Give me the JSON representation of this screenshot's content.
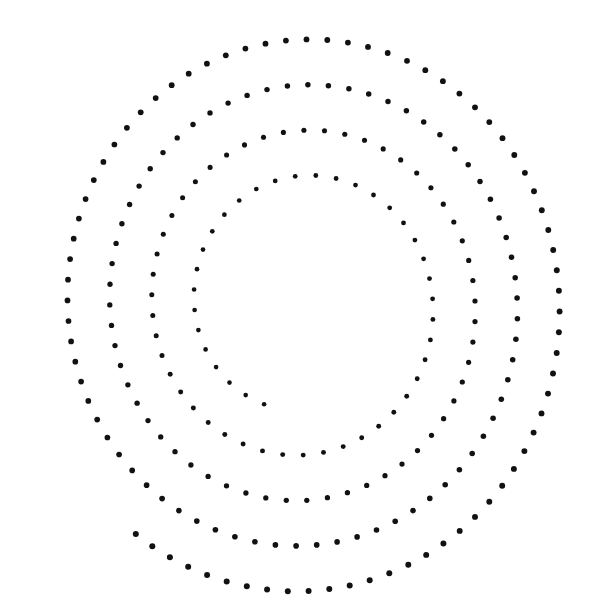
{
  "figure": {
    "description": "Dotted spiral",
    "background": "#ffffff",
    "dot_color": "#111111",
    "width": 601,
    "height": 613
  },
  "spiral": {
    "center_x": 303,
    "center_y": 304,
    "x_scale": 0.93,
    "y_scale": 1.0,
    "start_radius": 292,
    "end_radius": 108,
    "start_angle_deg": 128,
    "end_angle_deg": -1332,
    "dot_spacing_px": 20.5,
    "outer_dot_radius": 3.0,
    "inner_dot_radius": 2.3,
    "outer_end_point": [
      127,
      527
    ],
    "inner_end_point": [
      268,
      405
    ],
    "loops": 4
  }
}
